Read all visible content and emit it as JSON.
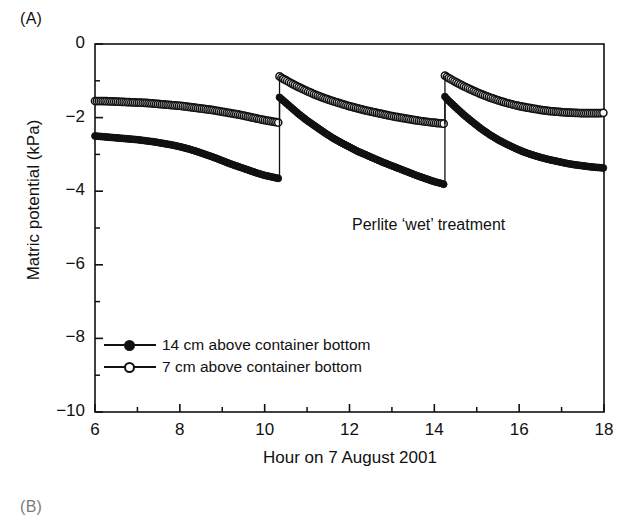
{
  "panel": {
    "label_a": "(A)",
    "label_b": "(B)"
  },
  "annotation": {
    "text": "Perlite ‘wet’ treatment"
  },
  "legend": {
    "items": [
      {
        "marker": "filled-circle",
        "label": "14 cm above container bottom"
      },
      {
        "marker": "open-circle",
        "label": "7 cm above container bottom"
      }
    ]
  },
  "chart_data": {
    "type": "line",
    "title": "",
    "xlabel": "Hour on 7 August 2001",
    "ylabel": "Matric potential (kPa)",
    "xlim": [
      6,
      18
    ],
    "ylim": [
      -10,
      0
    ],
    "xticks": [
      6,
      8,
      10,
      12,
      14,
      16,
      18
    ],
    "xtick_labels": [
      "6",
      "8",
      "10",
      "12",
      "14",
      "16",
      "18"
    ],
    "xminor_ticks": [
      7,
      9,
      11,
      13,
      15,
      17
    ],
    "yticks": [
      0,
      -2,
      -4,
      -6,
      -8,
      -10
    ],
    "ytick_labels": [
      "0",
      "−2",
      "−4",
      "−6",
      "−8",
      "−10"
    ],
    "yminor_ticks": [
      -1,
      -3,
      -5,
      -7,
      -9
    ],
    "grid": false,
    "legend_position": "lower-left inside axes",
    "annotations": [
      {
        "text": "Perlite ‘wet’ treatment",
        "x": 12.7,
        "y": -4.7
      }
    ],
    "events": [
      {
        "name": "irrigation-1",
        "x": 10.35
      },
      {
        "name": "irrigation-2",
        "x": 14.25
      }
    ],
    "series": [
      {
        "name": "14 cm above container bottom",
        "marker": "filled-circle",
        "color": "#111111",
        "segments": [
          {
            "x": [
              6.0,
              6.2,
              6.4,
              6.6,
              6.8,
              7.0,
              7.2,
              7.4,
              7.6,
              7.8,
              8.0,
              8.2,
              8.4,
              8.6,
              8.8,
              9.0,
              9.2,
              9.4,
              9.6,
              9.8,
              10.0,
              10.2,
              10.35
            ],
            "y": [
              -2.5,
              -2.52,
              -2.54,
              -2.56,
              -2.58,
              -2.6,
              -2.63,
              -2.66,
              -2.7,
              -2.74,
              -2.79,
              -2.85,
              -2.92,
              -3.0,
              -3.08,
              -3.17,
              -3.26,
              -3.34,
              -3.42,
              -3.5,
              -3.57,
              -3.62,
              -3.66
            ]
          },
          {
            "x": [
              10.35,
              10.4,
              10.6,
              10.8,
              11.0,
              11.2,
              11.4,
              11.6,
              11.8,
              12.0,
              12.2,
              12.4,
              12.6,
              12.8,
              13.0,
              13.2,
              13.4,
              13.6,
              13.8,
              14.0,
              14.2,
              14.25
            ],
            "y": [
              -1.45,
              -1.5,
              -1.7,
              -1.9,
              -2.08,
              -2.24,
              -2.4,
              -2.55,
              -2.68,
              -2.8,
              -2.92,
              -3.02,
              -3.12,
              -3.22,
              -3.31,
              -3.4,
              -3.49,
              -3.58,
              -3.66,
              -3.74,
              -3.8,
              -3.83
            ]
          },
          {
            "x": [
              14.25,
              14.3,
              14.5,
              14.7,
              14.9,
              15.1,
              15.3,
              15.5,
              15.7,
              15.9,
              16.1,
              16.3,
              16.5,
              16.7,
              16.9,
              17.1,
              17.3,
              17.5,
              17.7,
              17.9,
              18.0
            ],
            "y": [
              -1.43,
              -1.5,
              -1.72,
              -1.93,
              -2.12,
              -2.3,
              -2.46,
              -2.6,
              -2.72,
              -2.83,
              -2.93,
              -3.01,
              -3.08,
              -3.14,
              -3.19,
              -3.24,
              -3.28,
              -3.31,
              -3.34,
              -3.36,
              -3.37
            ]
          }
        ]
      },
      {
        "name": "7 cm above container bottom",
        "marker": "open-circle",
        "color": "#111111",
        "segments": [
          {
            "x": [
              6.0,
              6.2,
              6.4,
              6.6,
              6.8,
              7.0,
              7.2,
              7.4,
              7.6,
              7.8,
              8.0,
              8.2,
              8.4,
              8.6,
              8.8,
              9.0,
              9.2,
              9.4,
              9.6,
              9.8,
              10.0,
              10.2,
              10.35
            ],
            "y": [
              -1.55,
              -1.55,
              -1.56,
              -1.57,
              -1.58,
              -1.59,
              -1.6,
              -1.62,
              -1.64,
              -1.66,
              -1.68,
              -1.71,
              -1.74,
              -1.77,
              -1.8,
              -1.84,
              -1.88,
              -1.92,
              -1.97,
              -2.02,
              -2.07,
              -2.11,
              -2.14
            ]
          },
          {
            "x": [
              10.35,
              10.4,
              10.6,
              10.8,
              11.0,
              11.2,
              11.4,
              11.6,
              11.8,
              12.0,
              12.2,
              12.4,
              12.6,
              12.8,
              13.0,
              13.2,
              13.4,
              13.6,
              13.8,
              14.0,
              14.2,
              14.25
            ],
            "y": [
              -0.88,
              -0.92,
              -1.05,
              -1.17,
              -1.28,
              -1.38,
              -1.47,
              -1.55,
              -1.62,
              -1.69,
              -1.75,
              -1.81,
              -1.86,
              -1.91,
              -1.96,
              -2.0,
              -2.04,
              -2.08,
              -2.11,
              -2.14,
              -2.16,
              -2.17
            ]
          },
          {
            "x": [
              14.25,
              14.3,
              14.5,
              14.7,
              14.9,
              15.1,
              15.3,
              15.5,
              15.7,
              15.9,
              16.1,
              16.3,
              16.5,
              16.7,
              16.9,
              17.1,
              17.3,
              17.5,
              17.7,
              17.9,
              18.0
            ],
            "y": [
              -0.86,
              -0.9,
              -1.03,
              -1.15,
              -1.26,
              -1.36,
              -1.45,
              -1.53,
              -1.6,
              -1.66,
              -1.71,
              -1.75,
              -1.79,
              -1.82,
              -1.84,
              -1.86,
              -1.87,
              -1.88,
              -1.88,
              -1.88,
              -1.87
            ]
          }
        ]
      }
    ]
  }
}
